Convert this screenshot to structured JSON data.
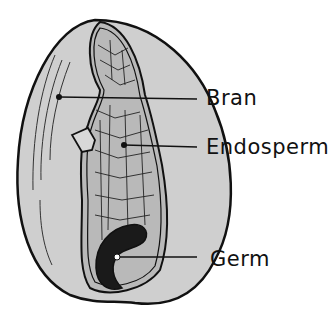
{
  "diagram": {
    "labels": [
      {
        "id": "bran",
        "text": "Bran"
      },
      {
        "id": "endosperm",
        "text": "Endosperm"
      },
      {
        "id": "germ",
        "text": "Germ"
      }
    ]
  },
  "colors": {
    "outline": "#111111",
    "shell": "#cfcfcf",
    "inner": "#b8b8b8",
    "germ": "#1a1a1a",
    "background": "#ffffff"
  }
}
